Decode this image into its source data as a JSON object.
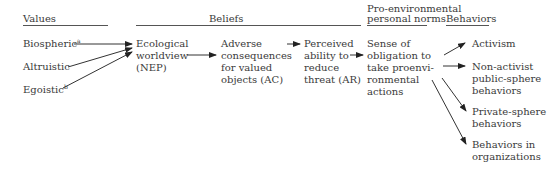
{
  "headers": {
    "values": "Values",
    "beliefs": "Beliefs",
    "norms_line1": "Pro-environmental",
    "norms_line2": "personal norms",
    "behaviors": "Behaviors"
  },
  "values": {
    "biospheric": "Biospheric",
    "biospheric_sup": "a",
    "altruistic": "Altruistic",
    "egoistic": "Egoistic",
    "egoistic_sup": "b"
  },
  "beliefs": {
    "nep": "Ecological\nworldview\n(NEP)",
    "ac": "Adverse\nconsequences\nfor valued\nobjects (AC)",
    "ar": "Perceived\nability to\nreduce\nthreat (AR)"
  },
  "norms": {
    "obligation": "Sense of\nobligation to\ntake proenvi-\nronmental\nactions"
  },
  "behaviors": {
    "activism": "Activism",
    "nonactivist": "Non-activist\npublic-sphere\nbehaviors",
    "private": "Private-sphere\nbehaviors",
    "organizations": "Behaviors in\norganizations"
  }
}
